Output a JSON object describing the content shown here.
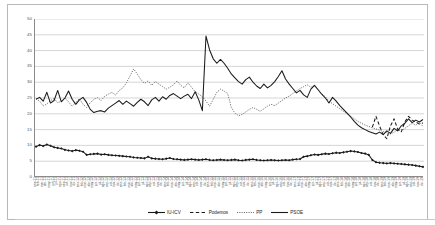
{
  "chart_data": {
    "type": "line",
    "title": "",
    "subtitle": "",
    "xlabel": "",
    "ylabel": "",
    "ylim": [
      0,
      50
    ],
    "ytick_step": 5,
    "yticks": [
      50,
      45,
      40,
      35,
      30,
      25,
      20,
      15,
      10,
      5,
      0
    ],
    "grid": true,
    "grid_axis": "y",
    "legend_position": "bottom",
    "legend": [
      "IU-ICV",
      "Podemos",
      "PP",
      "PSOE"
    ],
    "categories": [
      "ene-11",
      "feb-11",
      "mar-11",
      "abr-11",
      "may-11",
      "jun-11",
      "jul-11",
      "ago-11",
      "sep-11",
      "oct-11",
      "nov-11",
      "dic-11",
      "ene-12",
      "feb-12",
      "mar-12",
      "abr-12",
      "may-12",
      "jun-12",
      "jul-12",
      "ago-12",
      "sep-12",
      "oct-12",
      "nov-12",
      "dic-12",
      "ene-13",
      "feb-13",
      "mar-13",
      "abr-13",
      "may-13",
      "jun-13",
      "jul-13",
      "ago-13",
      "sep-13",
      "oct-13",
      "nov-13",
      "dic-13",
      "ene-14",
      "feb-14",
      "mar-14",
      "abr-14",
      "may-14",
      "jun-14",
      "jul-14",
      "ago-14",
      "sep-14",
      "oct-14",
      "nov-14",
      "dic-14",
      "ene-15",
      "feb-15",
      "mar-15",
      "abr-15",
      "may-15",
      "jun-15",
      "jul-15",
      "ago-15",
      "sep-15",
      "oct-15",
      "nov-15",
      "dic-15",
      "ene-16",
      "feb-16",
      "mar-16",
      "abr-16",
      "may-16",
      "jun-16",
      "jul-16",
      "ago-16",
      "sep-16",
      "oct-16",
      "nov-16",
      "dic-16",
      "ene-17",
      "feb-17",
      "mar-17",
      "abr-17",
      "may-17",
      "jun-17",
      "jul-17",
      "ago-17",
      "sep-17",
      "oct-17",
      "nov-17",
      "dic-17",
      "ene-18",
      "feb-18",
      "mar-18",
      "abr-18",
      "may-18",
      "jun-18",
      "jul-18",
      "ago-18",
      "sep-18",
      "oct-18",
      "nov-18",
      "dic-18",
      "ene-19",
      "feb-19",
      "mar-19",
      "abr-19",
      "may-19",
      "jun-19",
      "jul-19",
      "ago-19",
      "sep-19",
      "oct-19",
      "nov-19",
      "dic-19"
    ],
    "series": [
      {
        "name": "IU-ICV",
        "color": "#1a1a1a",
        "style": "solid-marker",
        "marker": "diamond",
        "values": [
          9.6,
          10.1,
          9.8,
          10.3,
          9.9,
          9.4,
          9.2,
          9.0,
          8.6,
          8.4,
          8.2,
          8.5,
          8.3,
          8.0,
          7.0,
          7.2,
          7.3,
          7.4,
          7.1,
          7.2,
          7.0,
          6.9,
          6.8,
          6.7,
          6.6,
          6.5,
          6.4,
          6.2,
          6.1,
          6.0,
          5.9,
          6.4,
          5.9,
          5.8,
          5.7,
          5.6,
          5.8,
          6.0,
          5.7,
          5.6,
          5.5,
          5.4,
          5.5,
          5.6,
          5.5,
          5.4,
          5.5,
          5.6,
          5.4,
          5.3,
          5.4,
          5.5,
          5.4,
          5.3,
          5.4,
          5.5,
          5.3,
          5.2,
          5.4,
          5.5,
          5.6,
          5.4,
          5.3,
          5.2,
          5.3,
          5.4,
          5.3,
          5.2,
          5.3,
          5.4,
          5.3,
          5.5,
          5.6,
          5.7,
          6.4,
          6.6,
          6.9,
          7.1,
          7.0,
          7.2,
          7.4,
          7.3,
          7.5,
          7.7,
          7.6,
          7.8,
          8.0,
          8.2,
          8.1,
          7.9,
          7.6,
          7.4,
          7.0,
          5.4,
          4.7,
          4.5,
          4.4,
          4.3,
          4.4,
          4.3,
          4.2,
          4.1,
          4.0,
          3.9,
          3.8,
          3.6,
          3.4,
          3.2
        ]
      },
      {
        "name": "Podemos",
        "color": "#1a1a1a",
        "style": "dashed",
        "values": [
          null,
          null,
          null,
          null,
          null,
          null,
          null,
          null,
          null,
          null,
          null,
          null,
          null,
          null,
          null,
          null,
          null,
          null,
          null,
          null,
          null,
          null,
          null,
          null,
          null,
          null,
          null,
          null,
          null,
          null,
          null,
          null,
          null,
          null,
          null,
          null,
          null,
          null,
          null,
          null,
          null,
          null,
          null,
          null,
          null,
          null,
          null,
          null,
          null,
          null,
          null,
          null,
          null,
          null,
          null,
          null,
          null,
          null,
          null,
          null,
          null,
          null,
          null,
          null,
          null,
          null,
          null,
          null,
          null,
          null,
          null,
          null,
          null,
          null,
          null,
          null,
          null,
          null,
          null,
          null,
          null,
          null,
          null,
          null,
          null,
          null,
          null,
          null,
          null,
          null,
          null,
          null,
          null,
          15.8,
          19.2,
          16.1,
          13.4,
          12.1,
          16.2,
          18.4,
          15.1,
          14.3,
          17.5,
          19.2,
          18.0,
          17.4,
          16.8,
          17.1
        ]
      },
      {
        "name": "PP",
        "color": "#5a5a5a",
        "style": "dotted",
        "values": [
          24.8,
          24.0,
          22.5,
          23.1,
          24.2,
          24.8,
          23.5,
          24.0,
          25.0,
          23.8,
          22.4,
          23.6,
          24.8,
          23.0,
          22.0,
          23.5,
          24.6,
          25.1,
          24.2,
          25.6,
          26.2,
          26.8,
          25.9,
          27.4,
          28.2,
          29.8,
          32.0,
          34.2,
          32.6,
          30.8,
          29.6,
          30.4,
          29.0,
          30.2,
          29.4,
          28.6,
          27.8,
          28.4,
          29.2,
          30.4,
          29.0,
          28.2,
          29.8,
          28.4,
          27.0,
          26.2,
          25.4,
          24.0,
          22.4,
          24.6,
          26.8,
          27.8,
          27.2,
          26.4,
          22.0,
          20.2,
          19.4,
          19.8,
          20.6,
          21.4,
          22.0,
          21.4,
          20.8,
          21.6,
          22.4,
          23.0,
          22.6,
          23.4,
          24.2,
          25.0,
          25.6,
          26.4,
          27.2,
          28.0,
          28.6,
          29.2,
          28.4,
          29.0,
          27.6,
          26.2,
          25.4,
          24.0,
          23.2,
          22.4,
          21.6,
          20.8,
          20.0,
          19.2,
          18.4,
          17.6,
          17.0,
          16.4,
          16.0,
          15.6,
          15.2,
          14.8,
          14.4,
          14.0,
          13.6,
          14.2,
          15.0,
          14.6,
          15.4,
          16.2,
          17.0,
          16.4,
          17.2,
          16.0
        ]
      },
      {
        "name": "PSOE",
        "color": "#1a1a1a",
        "style": "solid",
        "values": [
          24.6,
          25.2,
          24.0,
          26.8,
          23.4,
          24.2,
          27.4,
          23.8,
          25.0,
          27.2,
          24.6,
          23.0,
          24.4,
          25.2,
          23.6,
          21.4,
          20.4,
          20.8,
          21.0,
          20.6,
          21.8,
          22.6,
          23.4,
          24.2,
          23.0,
          24.0,
          23.2,
          22.4,
          23.6,
          24.6,
          23.8,
          22.6,
          24.4,
          25.2,
          24.0,
          25.4,
          24.6,
          25.8,
          26.4,
          25.6,
          24.8,
          25.6,
          26.2,
          24.8,
          27.0,
          24.4,
          21.0,
          44.6,
          40.2,
          37.4,
          36.0,
          37.2,
          36.0,
          34.4,
          32.6,
          31.4,
          30.2,
          29.4,
          30.8,
          31.6,
          30.0,
          28.8,
          28.0,
          29.4,
          28.2,
          29.0,
          30.2,
          31.8,
          33.6,
          31.0,
          29.4,
          28.0,
          26.6,
          27.4,
          26.0,
          25.2,
          27.8,
          29.0,
          27.6,
          26.2,
          25.0,
          23.4,
          25.2,
          24.0,
          22.6,
          21.4,
          20.2,
          19.0,
          17.6,
          16.4,
          15.6,
          15.0,
          14.4,
          14.0,
          13.6,
          14.2,
          13.4,
          14.6,
          13.8,
          15.4,
          14.6,
          16.2,
          17.0,
          18.4,
          17.2,
          18.0,
          17.4,
          18.2
        ]
      }
    ]
  }
}
